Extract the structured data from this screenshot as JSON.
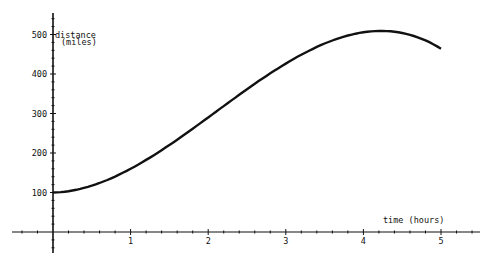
{
  "chart_data": {
    "type": "line",
    "title": "",
    "xlabel": "time (hours)",
    "ylabel": "distance (miles)",
    "ylabel_lines": [
      "distance",
      "(miles)"
    ],
    "xlim": [
      -0.55,
      5.55
    ],
    "ylim": [
      -50,
      550
    ],
    "x_ticks": [
      1,
      2,
      3,
      4,
      5
    ],
    "y_ticks": [
      100,
      200,
      300,
      400,
      500
    ],
    "grid": false,
    "legend": null,
    "series": [
      {
        "name": "distance",
        "color": "#111111",
        "x": [
          0,
          0.25,
          0.5,
          0.75,
          1,
          1.25,
          1.5,
          1.75,
          2,
          2.25,
          2.5,
          2.75,
          3,
          3.25,
          3.5,
          3.75,
          4,
          4.25,
          4.5,
          4.75,
          5
        ],
        "values": [
          100,
          105,
          116,
          133,
          160,
          189,
          221,
          254,
          290,
          326,
          360,
          394,
          426,
          455,
          479,
          498,
          506,
          508,
          500,
          487,
          465
        ]
      }
    ]
  }
}
